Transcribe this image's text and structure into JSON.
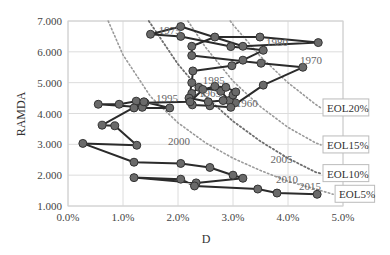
{
  "chart_data": {
    "type": "line",
    "title": "",
    "xlabel": "D",
    "ylabel": "RAMDA",
    "xlim": [
      0.0,
      5.0
    ],
    "ylim": [
      1.0,
      7.0
    ],
    "x_ticks": [
      "0.0%",
      "1.0%",
      "2.0%",
      "3.0%",
      "4.0%",
      "5.0%"
    ],
    "y_ticks": [
      "1.000",
      "2.000",
      "3.000",
      "4.000",
      "5.000",
      "6.000",
      "7.000"
    ],
    "grid": true,
    "series": [
      {
        "name": "Trajectory 1960-2017",
        "x": [
          3.04,
          2.93,
          2.78,
          2.38,
          2.25,
          2.26,
          2.58,
          2.96,
          3.55,
          4.27,
          3.51,
          2.25,
          2.25,
          2.67,
          3.49,
          4.55,
          3.18,
          2.05,
          1.5,
          2.05,
          2.96,
          3.55,
          3.18,
          2.98,
          2.27,
          2.25,
          2.2,
          2.55,
          2.82,
          3.0,
          3.05,
          2.87,
          2.67,
          2.45,
          2.22,
          1.4,
          1.24,
          0.93,
          0.55,
          1.35,
          1.2,
          1.85,
          1.38,
          0.62,
          0.85,
          1.25,
          0.27,
          1.2,
          2.05,
          2.58,
          3.0,
          3.18,
          2.33,
          1.2,
          2.05,
          2.3,
          3.45,
          3.8,
          4.53
        ],
        "y": [
          4.35,
          4.42,
          4.72,
          4.85,
          4.65,
          4.28,
          4.25,
          4.2,
          4.92,
          5.5,
          5.63,
          5.88,
          6.18,
          6.48,
          6.48,
          6.3,
          6.18,
          6.82,
          6.57,
          6.5,
          6.17,
          6.05,
          5.73,
          5.55,
          5.38,
          5.0,
          4.5,
          4.38,
          4.42,
          4.6,
          4.7,
          4.85,
          4.88,
          4.78,
          4.38,
          4.35,
          4.4,
          4.3,
          4.3,
          4.2,
          4.18,
          4.18,
          4.38,
          3.62,
          3.6,
          2.97,
          3.03,
          2.42,
          2.38,
          2.25,
          2.0,
          1.9,
          1.75,
          1.92,
          1.87,
          1.65,
          1.55,
          1.42,
          1.38
        ]
      }
    ],
    "point_labels": [
      {
        "text": "1960",
        "x": 3.05,
        "y": 4.22
      },
      {
        "text": "1965",
        "x": 2.38,
        "y": 4.55
      },
      {
        "text": "1970",
        "x": 4.22,
        "y": 5.62
      },
      {
        "text": "1975",
        "x": 1.65,
        "y": 6.57
      },
      {
        "text": "1980",
        "x": 3.6,
        "y": 6.2
      },
      {
        "text": "1985",
        "x": 2.45,
        "y": 4.95
      },
      {
        "text": "1995",
        "x": 1.6,
        "y": 4.38
      },
      {
        "text": "2000",
        "x": 1.82,
        "y": 2.97
      },
      {
        "text": "2005",
        "x": 3.68,
        "y": 2.38
      },
      {
        "text": "2010",
        "x": 3.78,
        "y": 1.75
      },
      {
        "text": "2015",
        "x": 4.2,
        "y": 1.52
      },
      {
        "text": "2017",
        "x": 4.9,
        "y": 1.42
      }
    ],
    "reference_curves": [
      {
        "name": "EOL5%",
        "label": "EOL5%",
        "x": [
          0.73,
          1.0,
          1.5,
          2.0,
          2.5,
          3.0,
          3.5,
          4.0,
          4.5,
          4.82
        ],
        "y": [
          7.0,
          5.9,
          4.55,
          3.7,
          3.05,
          2.55,
          2.15,
          1.8,
          1.55,
          1.38
        ]
      },
      {
        "name": "EOL10%",
        "label": "EOL10%",
        "x": [
          1.47,
          2.0,
          2.5,
          3.0,
          3.5,
          4.0,
          4.5,
          4.6
        ],
        "y": [
          7.0,
          5.6,
          4.55,
          3.75,
          3.1,
          2.55,
          2.1,
          2.05
        ]
      },
      {
        "name": "EOL15%",
        "label": "EOL15%",
        "x": [
          2.18,
          2.5,
          3.0,
          3.5,
          4.0,
          4.5,
          4.6
        ],
        "y": [
          7.0,
          6.15,
          5.05,
          4.22,
          3.55,
          3.05,
          2.98
        ]
      },
      {
        "name": "EOL20%",
        "label": "EOL20%",
        "x": [
          2.95,
          3.0,
          3.5,
          4.0,
          4.5,
          4.6
        ],
        "y": [
          7.0,
          6.88,
          5.85,
          5.0,
          4.3,
          4.18
        ]
      }
    ]
  }
}
